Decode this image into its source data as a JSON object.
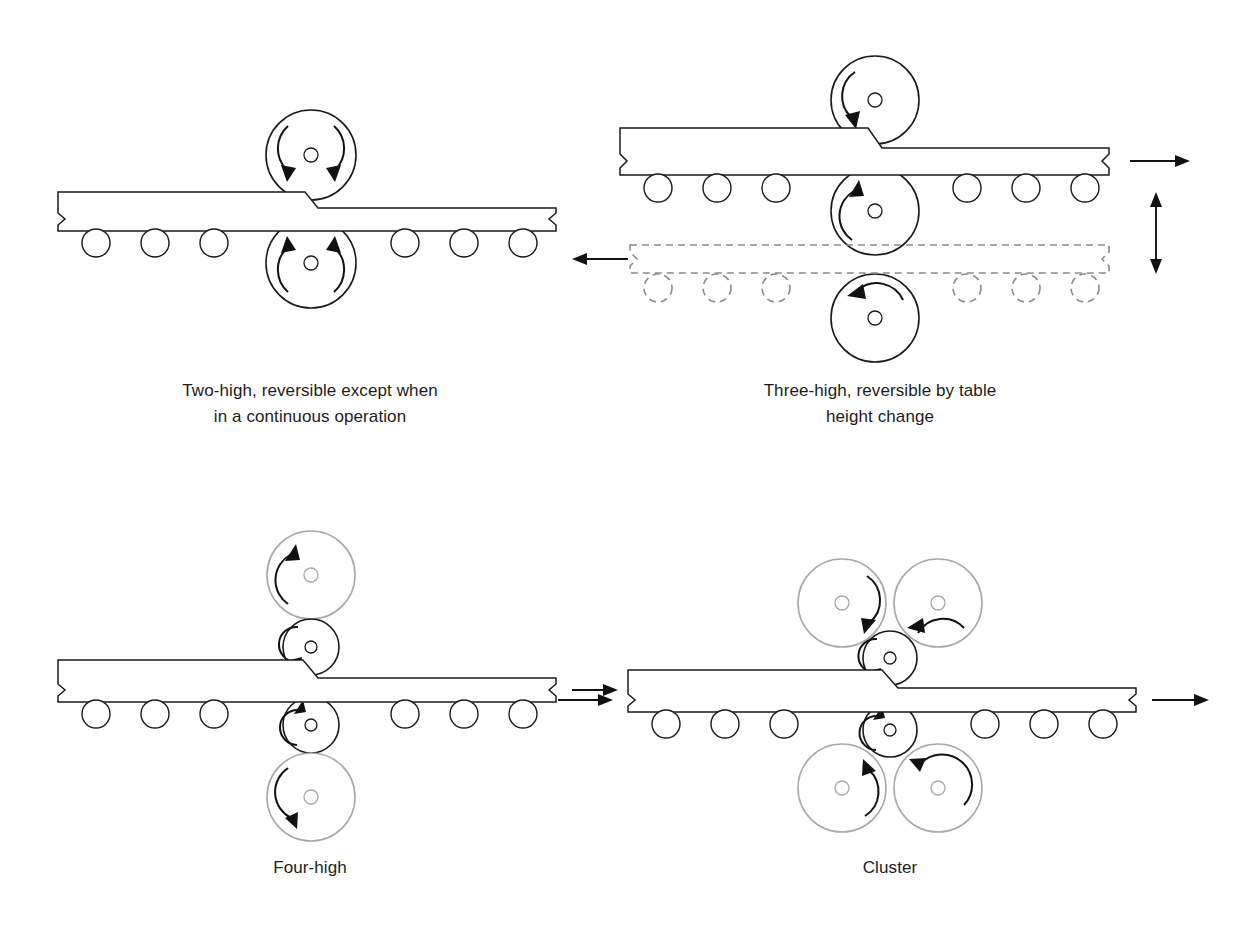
{
  "figure": {
    "background_color": "#ffffff",
    "line_color": "#1a1a1a",
    "backup_roll_color": "#a8a8a8",
    "dashed_color": "#8a8a8a"
  },
  "panels": [
    {
      "id": "two-high",
      "name": "Two-high mill",
      "caption_lines": [
        "Two-high, reversible except when",
        "in a continuous operation"
      ],
      "rolls": [
        {
          "role": "work-roll-top",
          "style": "dark",
          "radius": 45,
          "arrows": [
            "down-left",
            "down-right"
          ]
        },
        {
          "role": "work-roll-bottom",
          "style": "dark",
          "radius": 45,
          "arrows": [
            "up-left",
            "up-right"
          ]
        }
      ],
      "idler_count": 6,
      "workpiece": {
        "entry_thickness": 40,
        "exit_thickness": 28,
        "break_symbol_ends": [
          "left",
          "right"
        ]
      },
      "direction_arrows": []
    },
    {
      "id": "three-high",
      "name": "Three-high mill",
      "caption_lines": [
        "Three-high, reversible by table",
        "height change"
      ],
      "rolls": [
        {
          "role": "roll-top",
          "style": "dark",
          "radius": 44,
          "arrows": [
            "ccw"
          ]
        },
        {
          "role": "roll-middle",
          "style": "dark",
          "radius": 44,
          "arrows": [
            "cw"
          ]
        },
        {
          "role": "roll-bottom",
          "style": "dark",
          "radius": 44,
          "arrows": [
            "ccw"
          ]
        }
      ],
      "idler_count": 6,
      "workpiece": {
        "entry_thickness": 40,
        "exit_thickness": 28,
        "break_symbol_ends": [
          "left",
          "right"
        ]
      },
      "ghost_pass": {
        "style": "dashed",
        "idler_count": 6,
        "direction": "left"
      },
      "direction_arrows": [
        "right",
        "left",
        "vertical-double"
      ]
    },
    {
      "id": "four-high",
      "name": "Four-high mill",
      "caption_lines": [
        "Four-high"
      ],
      "rolls": [
        {
          "role": "backup-roll-top",
          "style": "light",
          "radius": 44,
          "arrows": [
            "ccw"
          ]
        },
        {
          "role": "work-roll-top",
          "style": "dark",
          "radius": 28,
          "arrows": [
            "ccw"
          ]
        },
        {
          "role": "work-roll-bottom",
          "style": "dark",
          "radius": 28,
          "arrows": [
            "ccw"
          ]
        },
        {
          "role": "backup-roll-bottom",
          "style": "light",
          "radius": 44,
          "arrows": [
            "ccw"
          ]
        }
      ],
      "idler_count": 6,
      "workpiece": {
        "entry_thickness": 40,
        "exit_thickness": 28,
        "break_symbol_ends": [
          "left",
          "right"
        ]
      },
      "direction_arrows": [
        "right"
      ]
    },
    {
      "id": "cluster",
      "name": "Cluster mill",
      "caption_lines": [
        "Cluster"
      ],
      "rolls": [
        {
          "role": "backup-roll-top-left",
          "style": "light",
          "radius": 44,
          "arrows": [
            "cw"
          ]
        },
        {
          "role": "backup-roll-top-right",
          "style": "light",
          "radius": 44,
          "arrows": [
            "ccw"
          ]
        },
        {
          "role": "work-roll-top",
          "style": "dark",
          "radius": 27,
          "arrows": [
            "ccw"
          ]
        },
        {
          "role": "work-roll-bottom",
          "style": "dark",
          "radius": 27,
          "arrows": [
            "ccw"
          ]
        },
        {
          "role": "backup-roll-bottom-left",
          "style": "light",
          "radius": 44,
          "arrows": [
            "cw"
          ]
        },
        {
          "role": "backup-roll-bottom-right",
          "style": "light",
          "radius": 44,
          "arrows": [
            "cw"
          ]
        }
      ],
      "idler_count": 6,
      "workpiece": {
        "entry_thickness": 40,
        "exit_thickness": 28,
        "break_symbol_ends": [
          "left",
          "right"
        ]
      },
      "direction_arrows": [
        "left-entry",
        "right-exit"
      ]
    }
  ]
}
